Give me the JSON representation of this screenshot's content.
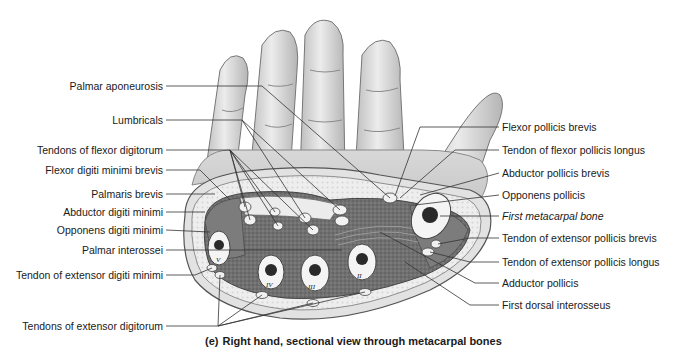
{
  "figure": {
    "caption_tag": "(e)",
    "caption_text": "Right hand, sectional view through metacarpal bones"
  },
  "labels_left": [
    {
      "text": "Palmar aponeurosis",
      "x": 163,
      "y": 86
    },
    {
      "text": "Lumbricals",
      "x": 163,
      "y": 120
    },
    {
      "text": "Tendons of flexor digitorum",
      "x": 163,
      "y": 150
    },
    {
      "text": "Flexor digiti minimi brevis",
      "x": 163,
      "y": 170
    },
    {
      "text": "Palmaris brevis",
      "x": 163,
      "y": 194
    },
    {
      "text": "Abductor digiti minimi",
      "x": 163,
      "y": 212
    },
    {
      "text": "Opponens digiti minimi",
      "x": 163,
      "y": 230
    },
    {
      "text": "Palmar interossei",
      "x": 163,
      "y": 250
    },
    {
      "text": "Tendon of extensor digiti minimi",
      "x": 163,
      "y": 275
    },
    {
      "text": "Tendons of extensor digitorum",
      "x": 163,
      "y": 326
    }
  ],
  "labels_right": [
    {
      "text": "Flexor pollicis brevis",
      "x": 502,
      "y": 127,
      "italic": false
    },
    {
      "text": "Tendon of flexor pollicis longus",
      "x": 502,
      "y": 150,
      "italic": false
    },
    {
      "text": "Abductor pollicis brevis",
      "x": 502,
      "y": 173,
      "italic": false
    },
    {
      "text": "Opponens pollicis",
      "x": 502,
      "y": 195,
      "italic": false
    },
    {
      "text": "First metacarpal bone",
      "x": 502,
      "y": 216,
      "italic": true
    },
    {
      "text": "Tendon of extensor pollicis brevis",
      "x": 502,
      "y": 238,
      "italic": false
    },
    {
      "text": "Tendon of extensor pollicis longus",
      "x": 502,
      "y": 262,
      "italic": false
    },
    {
      "text": "Adductor pollicis",
      "x": 502,
      "y": 283,
      "italic": false
    },
    {
      "text": "First dorsal interosseus",
      "x": 502,
      "y": 305,
      "italic": false
    }
  ],
  "bone_numerals": [
    "V",
    "IV",
    "III",
    "II"
  ],
  "colors": {
    "skin": "#dedede",
    "skin_shade": "#b9b9b9",
    "muscle": "#6f6f6f",
    "fat": "#ececec",
    "bone": "#f4f4f4",
    "marrow": "#2a2a2a",
    "line": "#333333"
  }
}
